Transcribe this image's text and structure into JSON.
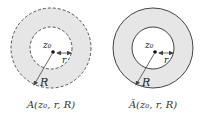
{
  "figures": [
    {
      "id": "open-annulus",
      "caption": "A(z₀, r, R)",
      "center_label": "z₀",
      "inner_radius_label": "r",
      "outer_radius_label": "R",
      "boundary_style": "dashed"
    },
    {
      "id": "closed-annulus",
      "caption": "Ā(z₀, r, R)",
      "center_label": "z₀",
      "inner_radius_label": "r",
      "outer_radius_label": "R",
      "boundary_style": "solid"
    }
  ],
  "colors": {
    "fill": "#e6e6e6",
    "stroke": "#444444",
    "background": "#ffffff"
  }
}
